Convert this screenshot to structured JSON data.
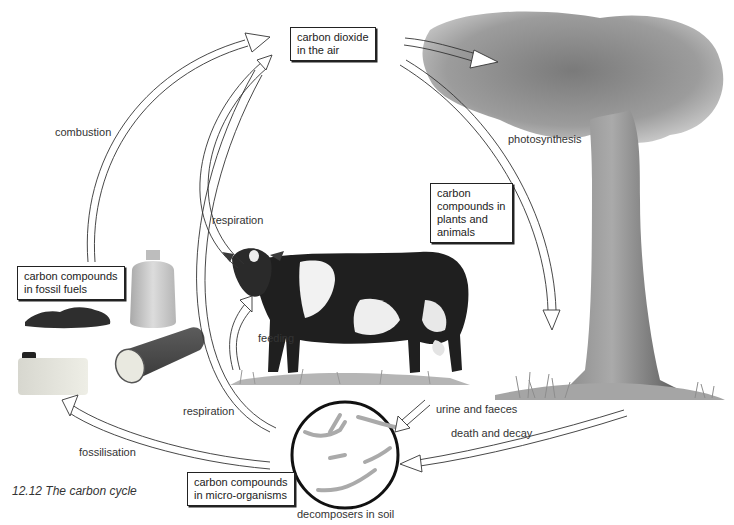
{
  "figure": {
    "caption": "12.12 The carbon cycle"
  },
  "boxes": {
    "air": [
      "carbon dioxide",
      "in the air"
    ],
    "plants_animals": [
      "carbon",
      "compounds in",
      "plants and",
      "animals"
    ],
    "fossil_fuels": [
      "carbon compounds",
      "in fossil fuels"
    ],
    "micro_organisms": [
      "carbon compounds",
      "in micro-organisms"
    ]
  },
  "labels": {
    "combustion": "combustion",
    "photosynthesis": "photosynthesis",
    "respiration_animal": "respiration",
    "feeding": "feeding",
    "respiration_micro": "respiration",
    "urine_faeces": "urine and faeces",
    "death_decay": "death and decay",
    "fossilisation": "fossilisation",
    "decomposers": "decomposers in soil"
  },
  "illustrations": {
    "tree": "tree-illustration",
    "cow": "cow-illustration",
    "coal": "coal-lumps-illustration",
    "gas_cylinder": "gas-cylinder-illustration",
    "fuel_can": "fuel-can-illustration",
    "log": "log-illustration",
    "soil_circle": "decomposers-magnified-circle"
  },
  "colors": {
    "ink": "#222222",
    "foliage": "#8a8a8a",
    "trunk": "#6e6e6e",
    "grass": "#9a9a9a"
  }
}
